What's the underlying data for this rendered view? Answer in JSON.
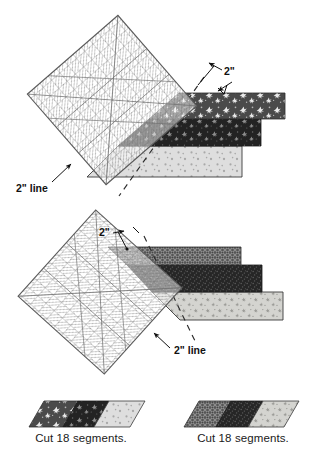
{
  "figure": {
    "title_visible": false,
    "background_color": "#ffffff",
    "panels": [
      {
        "id": "panel-top",
        "name": "top-ruler-strip-diagram",
        "ruler": {
          "name": "quilting-ruler",
          "orientation": "rotated-45-left",
          "grid_color": "#6f6f6f",
          "fill": "rgba(255,255,255,0.55)"
        },
        "labels": [
          {
            "id": "top-two-inch",
            "text": "2\"",
            "x": 225,
            "y": 75
          },
          {
            "id": "top-two-inch-line",
            "text": "2\" line",
            "x": 18,
            "y": 190
          }
        ],
        "strips": [
          {
            "id": "top-strip-1",
            "pattern": "dark-floral-sprig",
            "color": "#4a4a4a"
          },
          {
            "id": "top-strip-2",
            "pattern": "black-floral-sprig",
            "color": "#232323"
          },
          {
            "id": "top-strip-3",
            "pattern": "light-dot",
            "color": "#d8d8d6"
          }
        ],
        "cut_line": {
          "id": "top-cut-line",
          "style": "dashed"
        }
      },
      {
        "id": "panel-middle",
        "name": "bottom-ruler-strip-diagram",
        "ruler": {
          "name": "quilting-ruler",
          "orientation": "rotated-45-right",
          "grid_color": "#6f6f6f",
          "fill": "rgba(255,255,255,0.55)"
        },
        "labels": [
          {
            "id": "mid-two-inch",
            "text": "2\"",
            "x": 100,
            "y": 236
          },
          {
            "id": "mid-two-inch-line",
            "text": "2\" line",
            "x": 175,
            "y": 352
          }
        ],
        "strips": [
          {
            "id": "mid-strip-1",
            "pattern": "dark-crosshatch",
            "color": "#4f4f4f"
          },
          {
            "id": "mid-strip-2",
            "pattern": "black-speckle",
            "color": "#282828"
          },
          {
            "id": "mid-strip-3",
            "pattern": "light-star",
            "color": "#cfcfcc"
          }
        ],
        "cut_line": {
          "id": "mid-cut-line",
          "style": "dashed"
        }
      }
    ],
    "segments": [
      {
        "id": "segment-left",
        "name": "cut-segment-left",
        "caption": "Cut 18 segments.",
        "bands": [
          {
            "pattern": "dark-floral-sprig",
            "color": "#4a4a4a"
          },
          {
            "pattern": "black-floral-sprig",
            "color": "#232323"
          },
          {
            "pattern": "light-dot",
            "color": "#d8d8d6"
          }
        ]
      },
      {
        "id": "segment-right",
        "name": "cut-segment-right",
        "caption": "Cut 18 segments.",
        "bands": [
          {
            "pattern": "dark-crosshatch",
            "color": "#4f4f4f"
          },
          {
            "pattern": "black-speckle",
            "color": "#282828"
          },
          {
            "pattern": "light-star",
            "color": "#cfcfcc"
          }
        ]
      }
    ]
  }
}
